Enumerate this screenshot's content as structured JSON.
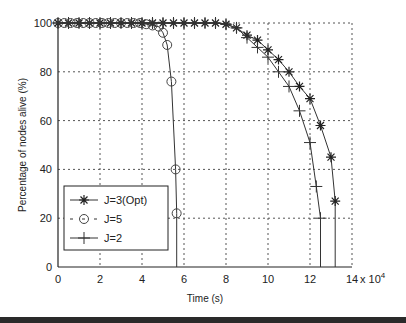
{
  "chart_data": {
    "type": "line",
    "title": "",
    "xlabel": "Time (s)",
    "ylabel": "Percentage of nodes alive (%)",
    "x_multiplier_label": "x 10^4",
    "xlim": [
      0,
      14
    ],
    "ylim": [
      0,
      100
    ],
    "xticks": [
      "0",
      "2",
      "4",
      "6",
      "8",
      "10",
      "12",
      "14"
    ],
    "yticks": [
      "0",
      "20",
      "40",
      "60",
      "80",
      "100"
    ],
    "grid": true,
    "legend_position": "lower left (inside)",
    "series": [
      {
        "name": "J=3(Opt)",
        "marker": "star",
        "x": [
          0,
          0.5,
          1,
          1.5,
          2,
          2.5,
          3,
          3.5,
          4,
          4.5,
          5,
          5.5,
          6,
          6.5,
          7,
          7.5,
          8,
          8.5,
          9,
          9.5,
          10,
          10.5,
          11,
          11.5,
          12,
          12.5,
          13,
          13.2,
          13.2
        ],
        "y": [
          100,
          100,
          100,
          100,
          100,
          100,
          100,
          100,
          100,
          100,
          100,
          100,
          100,
          100,
          100,
          100,
          99.5,
          98,
          95,
          93,
          89,
          85,
          80,
          74,
          69,
          58,
          45,
          27,
          0
        ]
      },
      {
        "name": "J=5",
        "marker": "circle",
        "x": [
          0,
          0.3,
          0.6,
          0.9,
          1.2,
          1.5,
          1.8,
          2.1,
          2.4,
          2.7,
          3,
          3.3,
          3.6,
          3.9,
          4.2,
          4.5,
          4.8,
          5,
          5.2,
          5.4,
          5.6,
          5.65,
          5.65
        ],
        "y": [
          100,
          100,
          100,
          100,
          100,
          100,
          100,
          100,
          100,
          100,
          100,
          100,
          100,
          100,
          99.5,
          99,
          98.5,
          96,
          91,
          76,
          40,
          22,
          0
        ]
      },
      {
        "name": "J=2",
        "marker": "plus",
        "x": [
          0,
          0.5,
          1,
          1.5,
          2,
          2.5,
          3,
          3.5,
          4,
          4.5,
          5,
          5.5,
          6,
          6.5,
          7,
          7.5,
          8,
          8.5,
          9,
          9.5,
          10,
          10.5,
          11,
          11.5,
          12,
          12.3,
          12.5,
          12.5
        ],
        "y": [
          100,
          100,
          100,
          100,
          100,
          100,
          100,
          100,
          100,
          100,
          100,
          100,
          100,
          100,
          100,
          100,
          99.5,
          98,
          94,
          90,
          86,
          80,
          74,
          64,
          51,
          33,
          20,
          0
        ]
      }
    ]
  }
}
